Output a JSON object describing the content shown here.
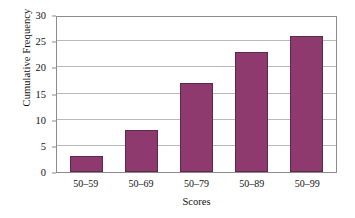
{
  "chart_data": {
    "type": "bar",
    "title": "",
    "categories": [
      "50–59",
      "50–69",
      "50–79",
      "50–89",
      "50–99"
    ],
    "values": [
      3,
      8,
      17,
      23,
      26
    ],
    "series": [
      {
        "name": "Cumulative Frequency",
        "values": [
          3,
          8,
          17,
          23,
          26
        ]
      }
    ],
    "xlabel": "Scores",
    "ylabel": "Cumulative Frequency",
    "ylim": [
      0,
      30
    ],
    "yticks": [
      0,
      5,
      10,
      15,
      20,
      25,
      30
    ],
    "ytick_labels": [
      "0",
      "5",
      "10",
      "15",
      "20",
      "25",
      "30"
    ],
    "grid": true,
    "grid_axis": "y",
    "legend": false,
    "legend_position": "none",
    "bar_color": "#8e3a6e",
    "bar_edge_color": "#5c2a49",
    "grid_color": "#b9b9b9",
    "frame_color": "#8c8c8c",
    "background_color": "#ffffff"
  }
}
